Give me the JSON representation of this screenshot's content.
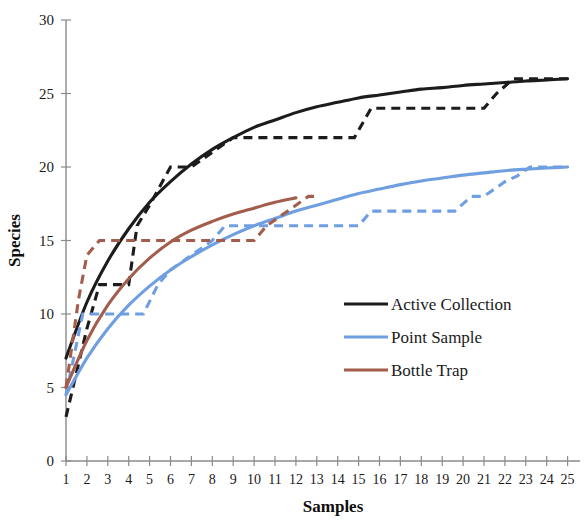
{
  "chart_data": {
    "type": "line",
    "title": "",
    "xlabel": "Samples",
    "ylabel": "Species",
    "xlim": [
      0,
      25.6
    ],
    "ylim": [
      0,
      30
    ],
    "xticks": [
      "1",
      "2",
      "3",
      "4",
      "5",
      "6",
      "7",
      "8",
      "9",
      "10",
      "11",
      "12",
      "13",
      "14",
      "15",
      "16",
      "17",
      "18",
      "19",
      "20",
      "21",
      "22",
      "23",
      "24",
      "25"
    ],
    "yticks": [
      "0",
      "5",
      "10",
      "15",
      "20",
      "25",
      "30"
    ],
    "grid": false,
    "legend_position": "center-right",
    "legend": [
      {
        "name": "Active Collection",
        "color": "#1c1c1c"
      },
      {
        "name": "Point Sample",
        "color": "#6f9fe0"
      },
      {
        "name": "Bottle Trap",
        "color": "#a35d4c"
      }
    ],
    "series": [
      {
        "name": "Active Collection",
        "style": "solid",
        "color": "#1c1c1c",
        "x": [
          1,
          2,
          3,
          4,
          5,
          6,
          7,
          8,
          9,
          10,
          11,
          12,
          13,
          14,
          15,
          16,
          17,
          18,
          19,
          20,
          21,
          22,
          23,
          24,
          25
        ],
        "values": [
          7.0,
          10.8,
          13.6,
          15.8,
          17.6,
          19.0,
          20.2,
          21.2,
          22.0,
          22.7,
          23.2,
          23.7,
          24.1,
          24.4,
          24.7,
          24.9,
          25.1,
          25.3,
          25.4,
          25.55,
          25.65,
          25.75,
          25.85,
          25.92,
          26.0
        ]
      },
      {
        "name": "Active Collection (observed)",
        "style": "dashed",
        "color": "#1c1c1c",
        "x": [
          1,
          2,
          2.6,
          3,
          4,
          4.4,
          5,
          6,
          6.4,
          7,
          8,
          9,
          9.5,
          14.8,
          15.6,
          16,
          21,
          21.6,
          22.4,
          25
        ],
        "values": [
          3.0,
          9.0,
          12.0,
          12.0,
          12.0,
          16.0,
          17.4,
          20.0,
          20.0,
          20.0,
          21.0,
          22.0,
          22.0,
          22.0,
          24.0,
          24.0,
          24.0,
          25.0,
          26.0,
          26.0
        ]
      },
      {
        "name": "Point Sample",
        "style": "solid",
        "color": "#6f9fe0",
        "x": [
          1,
          2,
          3,
          4,
          5,
          6,
          7,
          8,
          9,
          10,
          11,
          12,
          13,
          14,
          15,
          16,
          17,
          18,
          19,
          20,
          21,
          22,
          23,
          24,
          25
        ],
        "values": [
          4.5,
          7.0,
          9.0,
          10.6,
          11.9,
          13.0,
          13.9,
          14.7,
          15.4,
          16.0,
          16.5,
          17.0,
          17.4,
          17.8,
          18.2,
          18.5,
          18.8,
          19.05,
          19.25,
          19.45,
          19.6,
          19.75,
          19.85,
          19.93,
          20.0
        ]
      },
      {
        "name": "Point Sample (observed)",
        "style": "dashed",
        "color": "#6f9fe0",
        "x": [
          1,
          1.8,
          2,
          4.7,
          5.4,
          6,
          7,
          8,
          8.6,
          15,
          15.6,
          16,
          19.6,
          20.4,
          21,
          22,
          22.6,
          23.2,
          25
        ],
        "values": [
          4.5,
          10.0,
          10.0,
          10.0,
          12.0,
          13.0,
          14.0,
          15.0,
          16.0,
          16.0,
          17.0,
          17.0,
          17.0,
          18.0,
          18.0,
          19.0,
          19.4,
          20.0,
          20.0
        ]
      },
      {
        "name": "Bottle Trap",
        "style": "solid",
        "color": "#a35d4c",
        "x": [
          1,
          2,
          3,
          4,
          5,
          6,
          7,
          8,
          9,
          10,
          11,
          12
        ],
        "values": [
          5.0,
          8.2,
          10.6,
          12.4,
          13.8,
          14.9,
          15.7,
          16.3,
          16.8,
          17.2,
          17.6,
          17.9
        ]
      },
      {
        "name": "Bottle Trap (observed)",
        "style": "dashed",
        "color": "#a35d4c",
        "x": [
          1,
          1.6,
          2,
          2.6,
          3,
          10,
          10.6,
          11,
          12,
          12.6,
          13
        ],
        "values": [
          5.0,
          11.0,
          14.0,
          15.0,
          15.0,
          15.0,
          16.0,
          16.4,
          17.4,
          18.0,
          18.0
        ]
      }
    ]
  }
}
